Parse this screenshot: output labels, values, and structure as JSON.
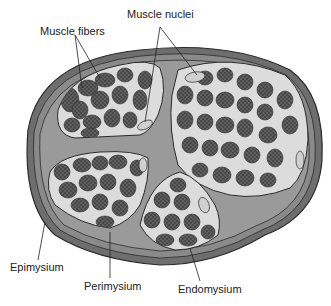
{
  "diagram": {
    "labels": {
      "muscle_nuclei": "Muscle nuclei",
      "muscle_fibers": "Muscle fibers",
      "epimysium": "Epimysium",
      "perimysium": "Perimysium",
      "endomysium": "Endomysium"
    },
    "colors": {
      "epimysium_outer": "#6e6e6e",
      "perimysium": "#9a9a9a",
      "endomysium": "#dcdcdc",
      "fiber": "#5a5a5a",
      "fiber_dots": "#2e2e2e",
      "nucleus": "#d0d0d0",
      "outline": "#2a2a2a"
    }
  }
}
